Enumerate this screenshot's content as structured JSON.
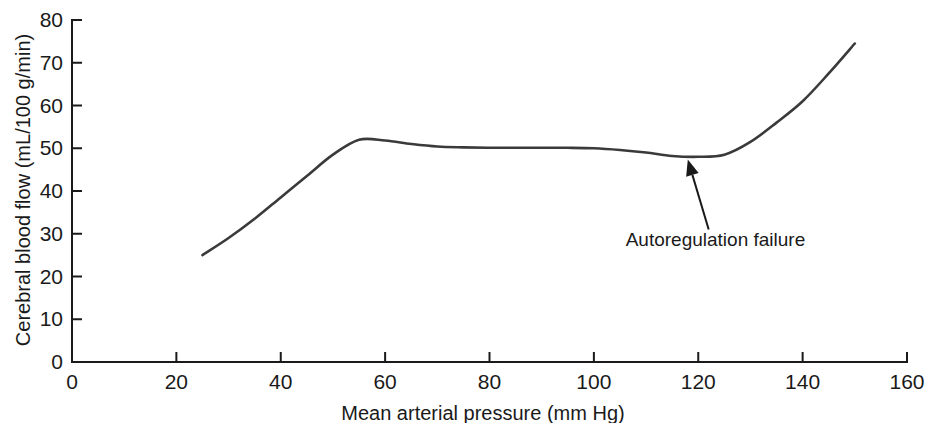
{
  "chart_data": {
    "type": "line",
    "title": "",
    "subtitle": "",
    "xlabel": "Mean arterial pressure (mm Hg)",
    "ylabel": "Cerebral blood flow (mL/100 g/min)",
    "xlim": [
      0,
      160
    ],
    "ylim": [
      0,
      80
    ],
    "xticks": [
      0,
      20,
      40,
      60,
      80,
      100,
      120,
      140,
      160
    ],
    "yticks": [
      0,
      10,
      20,
      30,
      40,
      50,
      60,
      70,
      80
    ],
    "xtick_labels": [
      "0",
      "20",
      "40",
      "60",
      "80",
      "100",
      "120",
      "140",
      "160"
    ],
    "ytick_labels": [
      "0",
      "10",
      "20",
      "30",
      "40",
      "50",
      "60",
      "70",
      "80"
    ],
    "grid": false,
    "legend": false,
    "legend_position": "none",
    "line_color": "#3a3a3a",
    "axis_color": "#1a1a1a",
    "series": [
      {
        "name": "Cerebral blood flow autoregulation curve",
        "x": [
          25,
          30,
          35,
          40,
          45,
          50,
          55,
          60,
          65,
          70,
          75,
          80,
          85,
          90,
          95,
          100,
          105,
          110,
          115,
          120,
          125,
          130,
          135,
          140,
          145,
          150
        ],
        "values": [
          25,
          29,
          33.5,
          38.5,
          43.5,
          48.5,
          52,
          51.8,
          51,
          50.4,
          50.2,
          50.1,
          50.1,
          50.1,
          50.1,
          50,
          49.6,
          49,
          48.2,
          48,
          48.5,
          51.5,
          56,
          61,
          67.5,
          74.5
        ]
      }
    ],
    "annotations": [
      {
        "text": "Autoregulation failure",
        "target_x": 118,
        "target_y": 49,
        "label_x": 122,
        "label_y": 31
      }
    ]
  },
  "axis": {
    "y_title": "Cerebral blood flow (mL/100 g/min)",
    "x_title": "Mean arterial pressure (mm Hg)"
  }
}
